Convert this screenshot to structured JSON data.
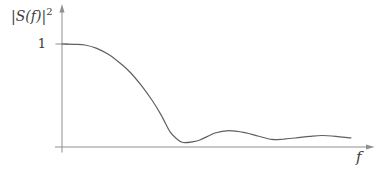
{
  "figure": {
    "y_axis_label": {
      "base": "|S(f)|",
      "exponent": "2"
    },
    "y_tick_label": "1",
    "x_axis_label": "f"
  },
  "colors": {
    "background": "#ffffff",
    "axis": "#8f8f8f",
    "curve": "#5f5f5f",
    "text": "#3c3c3c"
  },
  "chart_data": {
    "type": "line",
    "title": "",
    "xlabel": "f",
    "ylabel": "|S(f)|^2",
    "xlim": [
      0,
      1.05
    ],
    "ylim": [
      0,
      1.0
    ],
    "grid": false,
    "legend": "none",
    "x_note": "f axis has no numeric ticks; x given as fraction 0-1 of visible axis length",
    "y_ticks": [
      {
        "value": 1,
        "label": "1"
      }
    ],
    "points": [
      [
        0.0,
        1.0
      ],
      [
        0.04,
        0.997
      ],
      [
        0.074,
        0.99
      ],
      [
        0.11,
        0.96
      ],
      [
        0.148,
        0.903
      ],
      [
        0.185,
        0.82
      ],
      [
        0.219,
        0.728
      ],
      [
        0.255,
        0.6
      ],
      [
        0.29,
        0.456
      ],
      [
        0.32,
        0.31
      ],
      [
        0.348,
        0.15
      ],
      [
        0.37,
        0.08
      ],
      [
        0.39,
        0.044
      ],
      [
        0.42,
        0.05
      ],
      [
        0.445,
        0.068
      ],
      [
        0.494,
        0.136
      ],
      [
        0.539,
        0.159
      ],
      [
        0.59,
        0.14
      ],
      [
        0.632,
        0.107
      ],
      [
        0.677,
        0.074
      ],
      [
        0.715,
        0.077
      ],
      [
        0.752,
        0.087
      ],
      [
        0.8,
        0.104
      ],
      [
        0.839,
        0.112
      ],
      [
        0.884,
        0.104
      ],
      [
        0.932,
        0.088
      ]
    ]
  }
}
